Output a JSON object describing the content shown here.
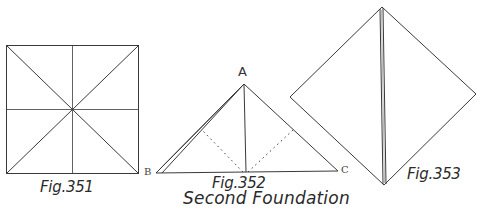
{
  "figures": [
    {
      "id": "fig351",
      "caption": "Fig.351"
    },
    {
      "id": "fig352",
      "caption": "Fig.352",
      "points": {
        "A": "A",
        "B": "B",
        "C": "C"
      }
    },
    {
      "id": "fig353",
      "caption": "Fig.353"
    }
  ],
  "subtitle": "Second Foundation",
  "colors": {
    "line": "#3a3a3a",
    "background": "#ffffff"
  }
}
